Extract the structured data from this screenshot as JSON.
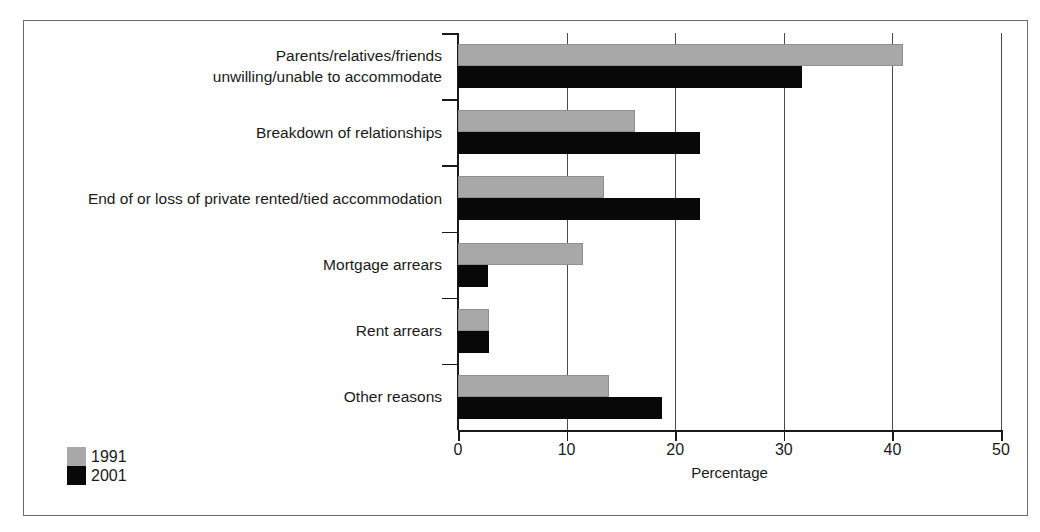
{
  "chart_data": {
    "type": "bar",
    "orientation": "horizontal",
    "title": "",
    "xlabel": "Percentage",
    "ylabel": "",
    "xlim": [
      0,
      50
    ],
    "xticks": [
      0,
      10,
      20,
      30,
      40,
      50
    ],
    "xtick_labels": [
      "0",
      "10",
      "20",
      "30",
      "40",
      "50"
    ],
    "grid": "vertical",
    "legend_position": "bottom-left",
    "categories": [
      "Parents/relatives/friends unwilling/unable to accommodate",
      "Breakdown of relationships",
      "End of or loss of private rented/tied accommodation",
      "Mortgage arrears",
      "Rent arrears",
      "Other reasons"
    ],
    "category_lines": [
      [
        "Parents/relatives/friends",
        "unwilling/unable to accommodate"
      ],
      [
        "Breakdown of relationships"
      ],
      [
        "End of or loss of private rented/tied accommodation"
      ],
      [
        "Mortgage arrears"
      ],
      [
        "Rent arrears"
      ],
      [
        "Other reasons"
      ]
    ],
    "series": [
      {
        "name": "1991",
        "color": "#a8a8a8",
        "values": [
          41.0,
          16.3,
          13.4,
          11.5,
          2.9,
          13.9
        ]
      },
      {
        "name": "2001",
        "color": "#080808",
        "values": [
          31.7,
          22.3,
          22.3,
          2.8,
          2.9,
          18.8
        ]
      }
    ]
  },
  "axis": {
    "x_title": "Percentage",
    "tick_labels": [
      "0",
      "10",
      "20",
      "30",
      "40",
      "50"
    ]
  },
  "legend": {
    "entries": [
      {
        "label": "1991",
        "color": "#a8a8a8"
      },
      {
        "label": "2001",
        "color": "#080808"
      }
    ]
  }
}
